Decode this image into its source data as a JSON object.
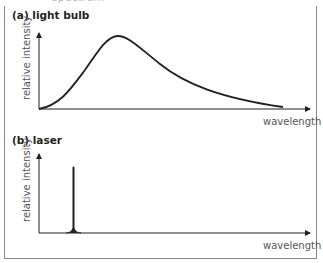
{
  "header": {
    "cutoff_text": "spectrum"
  },
  "panels": [
    {
      "label": "(a) light bulb",
      "ylabel": "relative intensity",
      "xlabel": "wavelength"
    },
    {
      "label": "(b) laser",
      "ylabel": "relative intensity",
      "xlabel": "wavelength"
    }
  ],
  "colors": {
    "line": "#231f20",
    "border": "#8a8a8a",
    "axis_text": "#555555"
  }
}
